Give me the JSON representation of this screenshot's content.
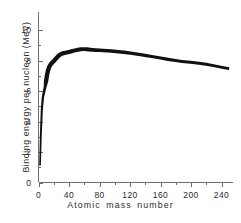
{
  "chart_data": {
    "type": "line",
    "title": "",
    "xlabel": "Atomic mass number",
    "ylabel": "Binding energy per nucleon (MeV)",
    "xlim": [
      0,
      255
    ],
    "ylim": [
      0,
      11.2
    ],
    "grid": false,
    "legend": "none",
    "x_ticks_major": [
      0,
      40,
      80,
      120,
      160,
      200,
      240
    ],
    "x_ticks_minor": [
      20,
      60,
      100,
      140,
      180,
      220
    ],
    "y_ticks_major": [
      0,
      2,
      4,
      6,
      8,
      10
    ],
    "y_ticks_minor": [
      1,
      3,
      5,
      7,
      9
    ],
    "x_tick_labels": [
      "0",
      "40",
      "80",
      "120",
      "160",
      "200",
      "240"
    ],
    "y_tick_labels": [
      "0",
      "2",
      "4",
      "6",
      "8",
      "10"
    ],
    "series": [
      {
        "name": "Binding energy per nucleon",
        "color": "#111111",
        "line_width": 3.0,
        "x": [
          2,
          3,
          4,
          6,
          7,
          9,
          10,
          11,
          12,
          14,
          16,
          19,
          20,
          23,
          24,
          27,
          28,
          31,
          32,
          35,
          39,
          40,
          45,
          48,
          51,
          56,
          59,
          63,
          65,
          70,
          75,
          80,
          85,
          90,
          95,
          100,
          110,
          115,
          120,
          127,
          133,
          140,
          150,
          160,
          170,
          180,
          190,
          197,
          200,
          208,
          220,
          232,
          238,
          245,
          250
        ],
        "y": [
          1.12,
          2.57,
          7.07,
          5.33,
          5.61,
          6.46,
          6.62,
          6.93,
          7.68,
          7.48,
          7.98,
          7.78,
          8.03,
          8.11,
          8.26,
          8.33,
          8.45,
          8.48,
          8.49,
          8.52,
          8.56,
          8.55,
          8.67,
          8.67,
          8.71,
          8.79,
          8.77,
          8.75,
          8.74,
          8.71,
          8.7,
          8.69,
          8.67,
          8.66,
          8.64,
          8.61,
          8.57,
          8.54,
          8.5,
          8.45,
          8.41,
          8.36,
          8.26,
          8.18,
          8.08,
          8.0,
          7.93,
          7.91,
          7.88,
          7.87,
          7.8,
          7.67,
          7.57,
          7.52,
          7.48
        ]
      }
    ],
    "annotations": {
      "peak_label": "",
      "peak_x": 56,
      "peak_y": 8.79
    }
  },
  "axes": {
    "x_axis_name": "atomic-mass-number-axis",
    "y_axis_name": "binding-energy-axis"
  }
}
